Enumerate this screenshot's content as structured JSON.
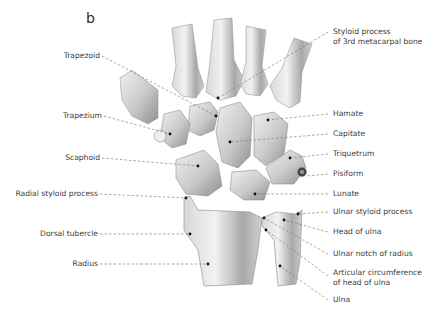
{
  "figure": {
    "panel_letter": "b",
    "left_labels": [
      {
        "id": "trapezoid",
        "text": "Trapezoid"
      },
      {
        "id": "trapezium",
        "text": "Trapezium"
      },
      {
        "id": "scaphoid",
        "text": "Scaphoid"
      },
      {
        "id": "radial-styloid",
        "text": "Radial styloid process"
      },
      {
        "id": "dorsal-tubercle",
        "text": "Dorsal tubercle"
      },
      {
        "id": "radius",
        "text": "Radius"
      }
    ],
    "right_labels": [
      {
        "id": "styloid-3rd-mc",
        "line1": "Styloid process",
        "line2": "of 3rd metacarpal bone"
      },
      {
        "id": "hamate",
        "text": "Hamate"
      },
      {
        "id": "capitate",
        "text": "Capitate"
      },
      {
        "id": "triquetrum",
        "text": "Triquetrum"
      },
      {
        "id": "pisiform",
        "text": "Pisiform"
      },
      {
        "id": "lunate",
        "text": "Lunate"
      },
      {
        "id": "ulnar-styloid",
        "text": "Ulnar styloid process"
      },
      {
        "id": "head-of-ulna",
        "text": "Head of ulna"
      },
      {
        "id": "ulnar-notch",
        "text": "Ulnar notch of radius"
      },
      {
        "id": "articular-circ",
        "line1": "Articular circumference",
        "line2": "of head of ulna"
      },
      {
        "id": "ulna",
        "text": "Ulna"
      }
    ],
    "colors": {
      "bone_light": "#e6e6e6",
      "bone_mid": "#bdbdbd",
      "bone_dark": "#8a8a8a",
      "leader_line": "#6e6e6e",
      "label_text": "#3c3c3c"
    }
  }
}
